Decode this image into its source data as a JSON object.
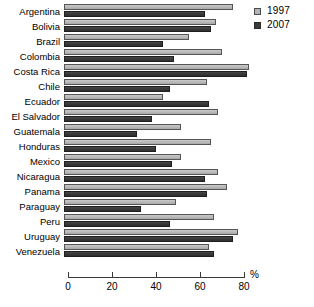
{
  "chart_data": {
    "type": "bar",
    "orientation": "horizontal",
    "title": "",
    "xlabel": "%",
    "ylabel": "",
    "xlim": [
      0,
      80
    ],
    "xticks": [
      0,
      20,
      40,
      60,
      80
    ],
    "grid": false,
    "legend_position": "top-right",
    "categories": [
      "Argentina",
      "Bolivia",
      "Brazil",
      "Colombia",
      "Costa Rica",
      "Chile",
      "Ecuador",
      "El Salvador",
      "Guatemala",
      "Honduras",
      "Mexico",
      "Nicaragua",
      "Panama",
      "Paraguay",
      "Peru",
      "Uruguay",
      "Venezuela"
    ],
    "series": [
      {
        "name": "1997",
        "color": "#b4b4b4",
        "values": [
          77,
          69,
          57,
          72,
          84,
          65,
          45,
          70,
          53,
          67,
          53,
          70,
          74,
          51,
          68,
          79,
          66
        ]
      },
      {
        "name": "2007",
        "color": "#3a3a3a",
        "values": [
          64,
          67,
          45,
          50,
          83,
          48,
          66,
          40,
          33,
          42,
          49,
          64,
          65,
          35,
          48,
          77,
          68
        ]
      }
    ]
  },
  "axis": {
    "unit_label": "%",
    "tick_labels": [
      "0",
      "20",
      "40",
      "60",
      "80"
    ]
  },
  "legend": {
    "items": [
      {
        "label": "1997"
      },
      {
        "label": "2007"
      }
    ]
  }
}
